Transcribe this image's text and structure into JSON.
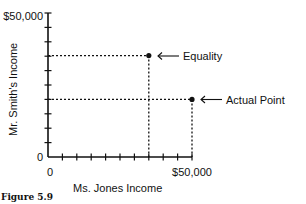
{
  "chart_data": {
    "type": "scatter",
    "title": "",
    "xlabel": "Ms. Jones Income",
    "ylabel": "Mr. Smith's Income",
    "xlim": [
      0,
      50000
    ],
    "ylim": [
      0,
      50000
    ],
    "x_tick_labels": [
      "0",
      "$50,000"
    ],
    "y_tick_labels": [
      "0",
      "$50,000"
    ],
    "x_tick_step": 5000,
    "y_tick_step": 5000,
    "grid": false,
    "points": [
      {
        "name": "Equality",
        "x": 35000,
        "y": 35000,
        "annotation": "Equality"
      },
      {
        "name": "Actual Point",
        "x": 50000,
        "y": 20000,
        "annotation": "Actual Point"
      }
    ]
  },
  "caption": "Figure 5.9",
  "labels": {
    "y_top": "$50,000",
    "y_zero": "0",
    "x_zero": "0",
    "x_right": "$50,000",
    "xlabel": "Ms. Jones Income",
    "ylabel": "Mr. Smith's Income",
    "equality": "Equality",
    "actual": "Actual Point"
  }
}
